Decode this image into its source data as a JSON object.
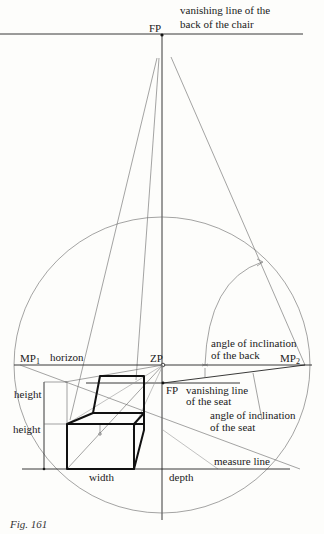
{
  "figure": {
    "caption": "Fig. 161",
    "labels": {
      "vanishing_back_line1": "vanishing line of the",
      "vanishing_back_line2": "back of the chair",
      "fp_top": "FP",
      "mp1": "MP",
      "mp1_sub": "1",
      "mp2": "MP",
      "mp2_sub": "2",
      "horizon": "horizon",
      "zp": "ZP",
      "fp_seat": "FP",
      "angle_back_line1": "angle of inclination",
      "angle_back_line2": "of the back",
      "vanishing_seat_line1": "vanishing line",
      "vanishing_seat_line2": "of the seat",
      "angle_seat_line1": "angle of inclination",
      "angle_seat_line2": "of the seat",
      "height_upper": "height",
      "height_lower": "height",
      "width": "width",
      "depth": "depth",
      "measure_line": "measure line"
    }
  }
}
